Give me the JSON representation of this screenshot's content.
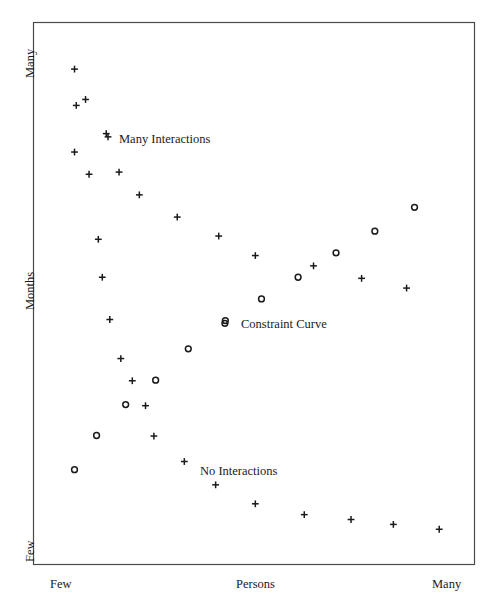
{
  "chart_data": {
    "type": "scatter",
    "title": "",
    "xlabel": "Persons",
    "ylabel": "Months",
    "x_tick_labels": [
      "Few",
      "Persons",
      "Many"
    ],
    "y_tick_labels": [
      "Many",
      "Months",
      "Few"
    ],
    "xlim": [
      0,
      100
    ],
    "ylim": [
      0,
      100
    ],
    "grid": false,
    "legend_position": "in-plot annotations",
    "annotations": [
      {
        "name": "many-interactions",
        "text": "Many Interactions",
        "marker": "plus",
        "x": 16.5,
        "y": 79.5
      },
      {
        "name": "constraint-curve",
        "text": "Constraint Curve",
        "marker": "circle",
        "x": 43.5,
        "y": 45.0
      },
      {
        "name": "no-interactions",
        "text": "No Interactions",
        "marker": "none",
        "x": 38.0,
        "y": 18.5
      }
    ],
    "series": [
      {
        "name": "Many Interactions",
        "marker": "plus",
        "color": "#1a1a1a",
        "points": [
          {
            "x": 9.3,
            "y": 91.4
          },
          {
            "x": 9.7,
            "y": 84.7
          },
          {
            "x": 11.8,
            "y": 85.8
          },
          {
            "x": 16.9,
            "y": 78.9
          },
          {
            "x": 9.3,
            "y": 76.1
          },
          {
            "x": 19.4,
            "y": 72.4
          },
          {
            "x": 24.0,
            "y": 68.2
          },
          {
            "x": 12.6,
            "y": 72.0
          },
          {
            "x": 32.6,
            "y": 64.1
          },
          {
            "x": 42.0,
            "y": 60.6
          },
          {
            "x": 14.7,
            "y": 60.0
          },
          {
            "x": 50.3,
            "y": 57.0
          },
          {
            "x": 15.6,
            "y": 53.0
          },
          {
            "x": 63.5,
            "y": 55.1
          },
          {
            "x": 74.4,
            "y": 52.8
          },
          {
            "x": 84.6,
            "y": 51.0
          },
          {
            "x": 17.3,
            "y": 45.2
          },
          {
            "x": 19.8,
            "y": 38.0
          },
          {
            "x": 22.4,
            "y": 33.9
          },
          {
            "x": 25.4,
            "y": 29.3
          },
          {
            "x": 27.3,
            "y": 23.7
          },
          {
            "x": 34.2,
            "y": 19.0
          },
          {
            "x": 41.3,
            "y": 14.7
          },
          {
            "x": 50.3,
            "y": 11.2
          },
          {
            "x": 61.4,
            "y": 9.2
          },
          {
            "x": 72.0,
            "y": 8.3
          },
          {
            "x": 81.6,
            "y": 7.4
          },
          {
            "x": 92.0,
            "y": 6.5
          }
        ]
      },
      {
        "name": "Constraint Curve",
        "marker": "circle",
        "color": "#1a1a1a",
        "points": [
          {
            "x": 9.3,
            "y": 17.5
          },
          {
            "x": 14.3,
            "y": 23.8
          },
          {
            "x": 20.9,
            "y": 29.5
          },
          {
            "x": 27.7,
            "y": 34.0
          },
          {
            "x": 35.1,
            "y": 39.8
          },
          {
            "x": 43.4,
            "y": 44.5
          },
          {
            "x": 51.7,
            "y": 49.0
          },
          {
            "x": 60.0,
            "y": 53.0
          },
          {
            "x": 68.6,
            "y": 57.5
          },
          {
            "x": 77.4,
            "y": 61.5
          },
          {
            "x": 86.4,
            "y": 65.9
          }
        ]
      }
    ]
  },
  "axes": {
    "y_top": "Many",
    "y_middle": "Months",
    "y_bottom": "Few",
    "x_left": "Few",
    "x_center": "Persons",
    "x_right": "Many"
  },
  "annotations": {
    "many_interactions": "Many Interactions",
    "constraint_curve": "Constraint Curve",
    "no_interactions": "No Interactions"
  },
  "style": {
    "frame_color": "#4a4a4a",
    "marker_color": "#1a1a1a",
    "background": "#ffffff"
  }
}
